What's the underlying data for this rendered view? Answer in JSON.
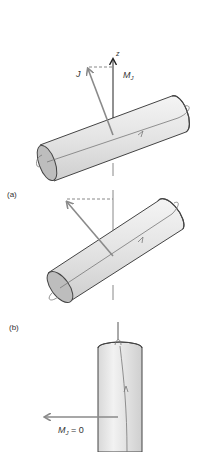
{
  "figure": {
    "panels": [
      {
        "id": "a",
        "label": "(a)",
        "axis_label": "z",
        "vector_label": "J",
        "projection_label_main": "M",
        "projection_label_sub": "J"
      },
      {
        "id": "b",
        "label": "(b)"
      },
      {
        "id": "c",
        "projection_label_main": "M",
        "projection_label_sub": "J",
        "projection_value": " = 0"
      }
    ],
    "colors": {
      "axis": "#333333",
      "vector": "#8a8a8a",
      "cylinder_fill": "#e6e6e6",
      "cylinder_outline": "#444444",
      "end_cap_fill": "#b8b8b8",
      "orbit": "#777777",
      "text": "#333333"
    }
  }
}
